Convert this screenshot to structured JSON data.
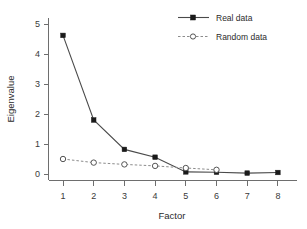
{
  "chart_data": {
    "type": "line",
    "title": "",
    "xlabel": "Factor",
    "ylabel": "Eigenvalue",
    "x": [
      1,
      2,
      3,
      4,
      5,
      6,
      7,
      8
    ],
    "xticklabels": [
      "1",
      "2",
      "3",
      "4",
      "5",
      "6",
      "7",
      "8"
    ],
    "yticklabels": [
      "0",
      "1",
      "2",
      "3",
      "4",
      "5"
    ],
    "yticks": [
      0,
      1,
      2,
      3,
      4,
      5
    ],
    "xlim": [
      0.6,
      8.4
    ],
    "ylim": [
      -0.25,
      5.4
    ],
    "grid": false,
    "legend_position": "top-right",
    "series": [
      {
        "name": "Real data",
        "marker": "filled-square",
        "linestyle": "solid",
        "color": "#1a1a1a",
        "values": [
          4.62,
          1.8,
          0.82,
          0.56,
          0.07,
          0.06,
          0.03,
          0.05
        ]
      },
      {
        "name": "Random data",
        "marker": "open-circle",
        "linestyle": "dashed",
        "color": "#8c8c8c",
        "values": [
          0.5,
          0.38,
          0.32,
          0.27,
          0.2,
          0.14,
          null,
          null
        ]
      }
    ]
  },
  "legend": {
    "entries": [
      {
        "label": "Real data"
      },
      {
        "label": "Random data"
      }
    ]
  },
  "axes": {
    "x_title": "Factor",
    "y_title": "Eigenvalue"
  }
}
